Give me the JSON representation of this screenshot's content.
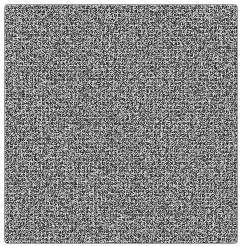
{
  "image": {
    "description": "grayscale micrograph of densely packed cells",
    "colors": {
      "base": "#7a7a7a",
      "dark": "#2a2a2a",
      "light": "#d8d8d8",
      "border": "#9a9a9a"
    }
  }
}
